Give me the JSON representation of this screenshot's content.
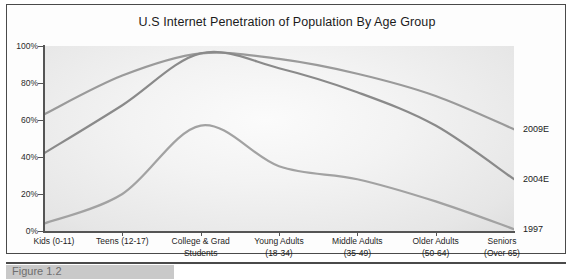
{
  "figure": {
    "title": "U.S Internet Penetration of Population By Age Group",
    "caption_partial": "Figure 1.2"
  },
  "axis": {
    "y_ticks": [
      "0%",
      "20%",
      "40%",
      "60%",
      "80%",
      "100%"
    ],
    "y_tick_values": [
      0,
      20,
      40,
      60,
      80,
      100
    ]
  },
  "chart_data": {
    "type": "line",
    "title": "U.S Internet Penetration of Population By Age Group",
    "xlabel": "",
    "ylabel": "",
    "ylim": [
      0,
      100
    ],
    "grid": false,
    "legend_position": "right-end-labels",
    "categories": [
      "Kids (0-11)",
      "Teens (12-17)",
      "College & Grad Students",
      "Young Adults (18-34)",
      "Middle Adults (35-49)",
      "Older Adults (50-64)",
      "Seniors (Over 65)"
    ],
    "category_lines": [
      [
        "Kids (0-11)"
      ],
      [
        "Teens (12-17)"
      ],
      [
        "College & Grad",
        "Students"
      ],
      [
        "Young Adults",
        "(18-34)"
      ],
      [
        "Middle Adults",
        "(35-49)"
      ],
      [
        "Older Adults",
        "(50-64)"
      ],
      [
        "Seniors",
        "(Over 65)"
      ]
    ],
    "series": [
      {
        "name": "2009E",
        "color": "#9a9a9a",
        "end_value": 55,
        "values": [
          63,
          84,
          96,
          93,
          85,
          73,
          55
        ]
      },
      {
        "name": "2004E",
        "color": "#8a8a8a",
        "end_value": 28,
        "values": [
          42,
          68,
          96,
          88,
          75,
          57,
          28
        ]
      },
      {
        "name": "1997",
        "color": "#a2a2a2",
        "end_value": 1,
        "values": [
          4,
          20,
          57,
          35,
          28,
          16,
          1
        ]
      }
    ]
  },
  "colors": {
    "frame": "#4a4a4a",
    "axis": "#555555",
    "text": "#1b1b1b",
    "plot_light": "#fbfbfb",
    "plot_dark": "#ababab"
  }
}
